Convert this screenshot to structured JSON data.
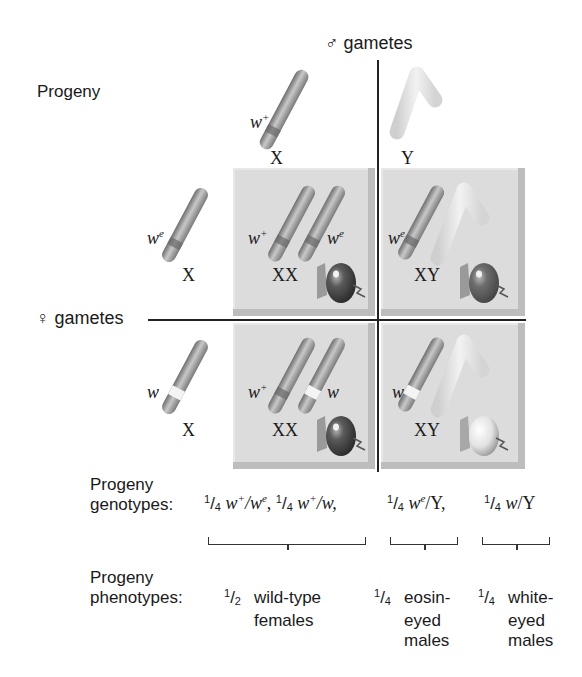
{
  "title": "Progeny",
  "male_gametes_label": "♂ gametes",
  "female_gametes_label": "♀ gametes",
  "male_gametes": [
    {
      "chromosome": "X",
      "allele": "w",
      "allele_sup": "+"
    },
    {
      "chromosome": "Y"
    }
  ],
  "female_gametes": [
    {
      "chromosome": "X",
      "allele": "w",
      "allele_sup": "e"
    },
    {
      "chromosome": "X",
      "allele": "w",
      "allele_sup": ""
    }
  ],
  "cells": [
    {
      "genotype": "XX",
      "alleles": [
        "w+",
        "we"
      ],
      "a1": "w",
      "a1sup": "+",
      "a2": "w",
      "a2sup": "e",
      "eye_color": "#7a7a7a"
    },
    {
      "genotype": "XY",
      "alleles": [
        "we"
      ],
      "a1": "w",
      "a1sup": "e",
      "eye_color": "#8a8a8a"
    },
    {
      "genotype": "XX",
      "alleles": [
        "w+",
        "w"
      ],
      "a1": "w",
      "a1sup": "+",
      "a2": "w",
      "a2sup": "",
      "eye_color": "#7a7a7a"
    },
    {
      "genotype": "XY",
      "alleles": [
        "w"
      ],
      "a1": "w",
      "a1sup": "",
      "eye_color": "#efefef"
    }
  ],
  "genotypes": {
    "label_line1": "Progeny",
    "label_line2": "genotypes:",
    "items": [
      {
        "num": "1",
        "den": "4",
        "text_a": "w",
        "sup_a": "+",
        "slash": "/",
        "text_b": "w",
        "sup_b": "e",
        "tail": ","
      },
      {
        "num": "1",
        "den": "4",
        "text_a": "w",
        "sup_a": "+",
        "slash": "/",
        "text_b": "w",
        "sup_b": "",
        "tail": ","
      },
      {
        "num": "1",
        "den": "4",
        "text_a": "w",
        "sup_a": "e",
        "slash": "/",
        "text_b": "Y",
        "sup_b": "",
        "tail": ","
      },
      {
        "num": "1",
        "den": "4",
        "text_a": "w",
        "sup_a": "",
        "slash": "/",
        "text_b": "Y",
        "sup_b": "",
        "tail": ""
      }
    ]
  },
  "phenotypes": {
    "label_line1": "Progeny",
    "label_line2": "phenotypes:",
    "items": [
      {
        "num": "1",
        "den": "2",
        "line1": "wild-type",
        "line2": "females",
        "line3": ""
      },
      {
        "num": "1",
        "den": "4",
        "line1": "eosin-",
        "line2": "eyed",
        "line3": "males"
      },
      {
        "num": "1",
        "den": "4",
        "line1": "white-",
        "line2": "eyed",
        "line3": "males"
      }
    ]
  },
  "colors": {
    "cell_bg": "#dcdcdc",
    "chromosome_x": "#9a9a9a",
    "chromosome_y": "#dedede",
    "line": "#222222"
  }
}
